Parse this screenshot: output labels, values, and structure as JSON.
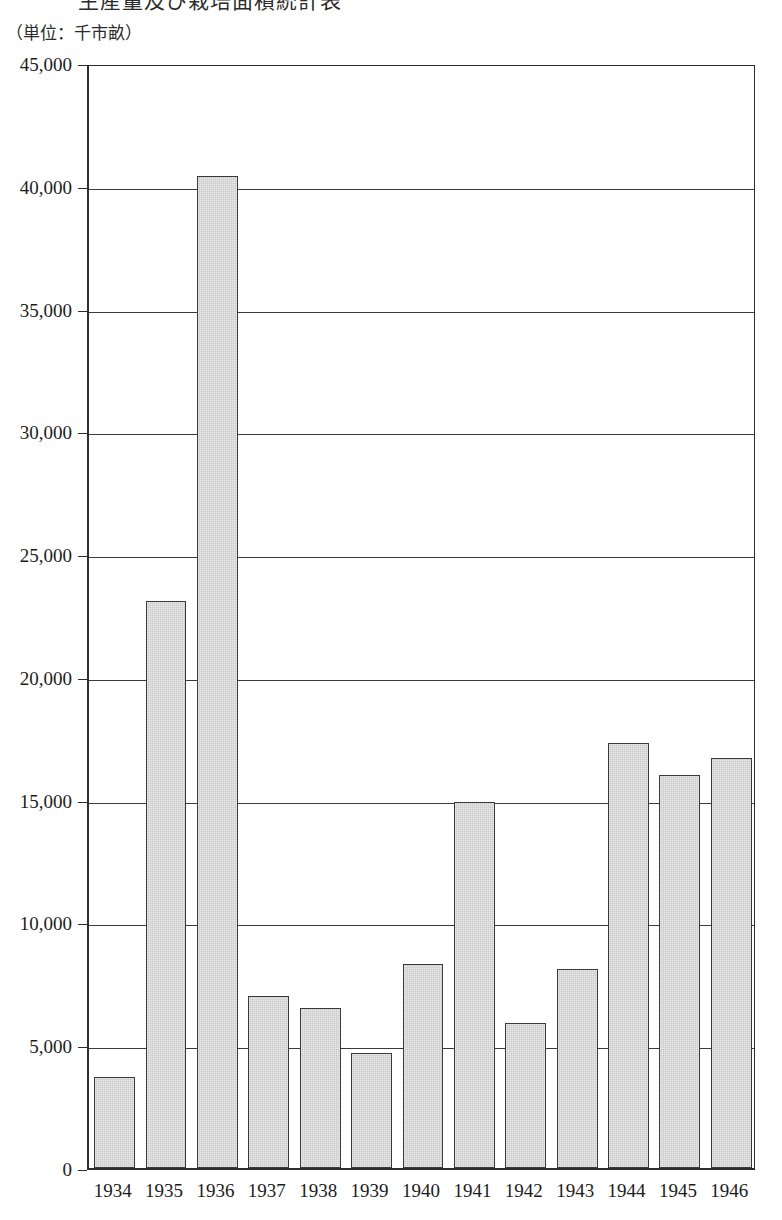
{
  "title": {
    "text_clipped": "生産量及び栽培面積統計表"
  },
  "unit_caption": "（単位：千市畝）",
  "chart_data": {
    "type": "bar",
    "title": "生産量及び栽培面積統計表",
    "subtitle": "（単位：千市畝）",
    "xlabel": "",
    "ylabel": "",
    "unit": "千市畝",
    "grid": true,
    "legend": "none",
    "ylim": [
      0,
      45000
    ],
    "ytick_step": 5000,
    "ytick_labels": [
      "45,000",
      "40,000",
      "35,000",
      "30,000",
      "25,000",
      "20,000",
      "15,000",
      "10,000",
      "5,000",
      "0"
    ],
    "ytick_values": [
      45000,
      40000,
      35000,
      30000,
      25000,
      20000,
      15000,
      10000,
      5000,
      0
    ],
    "categories": [
      "1934",
      "1935",
      "1936",
      "1937",
      "1938",
      "1939",
      "1940",
      "1941",
      "1942",
      "1943",
      "1944",
      "1945",
      "1946"
    ],
    "values": [
      3700,
      23100,
      40400,
      7000,
      6500,
      4700,
      8300,
      14900,
      5900,
      8100,
      17300,
      16000,
      16700
    ],
    "bar_fill_color": "#c9c9c9",
    "bar_border_color": "#3a3a3a",
    "axis_color": "#2d2d2d"
  }
}
